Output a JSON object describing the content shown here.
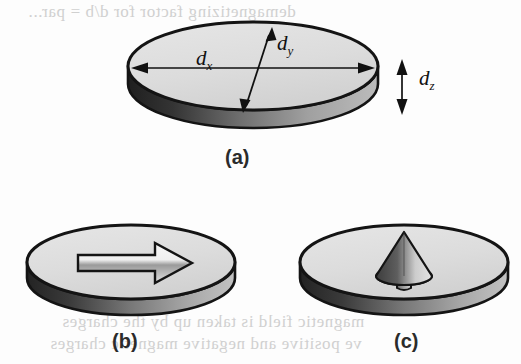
{
  "figure": {
    "caption_a": "(a)",
    "caption_b": "(b)",
    "caption_c": "(c)",
    "ghost_text_top": "demagnetizing factor for d/b = par...",
    "ghost_text_bottom_1": "magnetic field is taken up by the charges",
    "ghost_text_bottom_2": "ve positive and negative magnetic charges",
    "colors": {
      "outline": "#1a1a1a",
      "top_face": "#dedede",
      "side_wall_dark": "#2a2a2a",
      "side_wall_light": "#b4b4b4",
      "arrow_fill": "#f2f2f2",
      "cone_dark": "#4a4a4a",
      "cone_light": "#d8d8d8",
      "ghost": "#c9c9c9",
      "background": "#fdfdfd"
    }
  },
  "panel_a": {
    "label": "(a)",
    "description": "three-dimensional elliptical disk with dimension annotations",
    "dimensions": [
      {
        "name": "d-x",
        "symbol": "d",
        "subscript": "x",
        "axis": "horizontal-major",
        "arrow": "double-headed"
      },
      {
        "name": "d-y",
        "symbol": "d",
        "subscript": "y",
        "axis": "diagonal-minor",
        "arrow": "double-headed"
      },
      {
        "name": "d-z",
        "symbol": "d",
        "subscript": "z",
        "axis": "vertical-thickness",
        "arrow": "double-headed"
      }
    ]
  },
  "panel_b": {
    "label": "(b)",
    "description": "disk with in-plane magnetization",
    "arrow": {
      "name": "in-plane-magnetization-arrow",
      "direction": "right",
      "style": "flat-block-arrow"
    }
  },
  "panel_c": {
    "label": "(c)",
    "description": "disk with perpendicular magnetization",
    "arrow": {
      "name": "perpendicular-magnetization-arrow",
      "direction": "up-out-of-plane",
      "style": "three-dimensional-cone"
    }
  }
}
